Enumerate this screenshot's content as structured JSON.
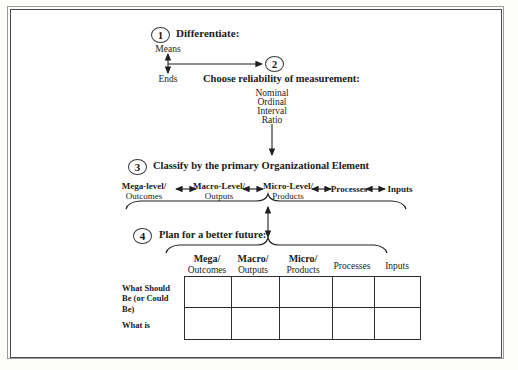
{
  "diagram": {
    "title_present": false,
    "steps": [
      {
        "number": "1",
        "heading": "Differentiate:",
        "means_label": "Means",
        "ends_label": "Ends"
      },
      {
        "number": "2",
        "heading": "Choose reliability of measurement:",
        "scales": [
          "Nominal",
          "Ordinal",
          "Interval",
          "Ratio"
        ]
      },
      {
        "number": "3",
        "heading": "Classify by the primary Organizational Element",
        "elements": [
          {
            "line1": "Mega-level/",
            "line2": "Outcomes"
          },
          {
            "line1": "Macro-Level/",
            "line2": "Outputs"
          },
          {
            "line1": "Micro-Level/",
            "line2": "Products"
          },
          {
            "line1": "Processes",
            "line2": ""
          },
          {
            "line1": "Inputs",
            "line2": ""
          }
        ]
      },
      {
        "number": "4",
        "heading": "Plan for a better future:"
      }
    ],
    "table": {
      "columns": [
        {
          "line1": "Mega/",
          "line2": "Outcomes",
          "bold_first": true
        },
        {
          "line1": "Macro/",
          "line2": "Outputs",
          "bold_first": true
        },
        {
          "line1": "Micro/",
          "line2": "Products",
          "bold_first": true
        },
        {
          "line1": "Processes",
          "line2": "",
          "bold_first": false
        },
        {
          "line1": "Inputs",
          "line2": "",
          "bold_first": false
        }
      ],
      "rows": [
        {
          "label_lines": [
            "What Should",
            "Be (or Could",
            "Be)"
          ],
          "cells": [
            "",
            "",
            "",
            "",
            ""
          ]
        },
        {
          "label_lines": [
            "What is"
          ],
          "cells": [
            "",
            "",
            "",
            "",
            ""
          ]
        }
      ]
    },
    "colors": {
      "ink": "#1a1a1a",
      "rule": "#2f2f2f",
      "frame_outer": "#9a9a9a",
      "frame_inner": "#4a4a4a",
      "page": "#ffffff"
    }
  }
}
